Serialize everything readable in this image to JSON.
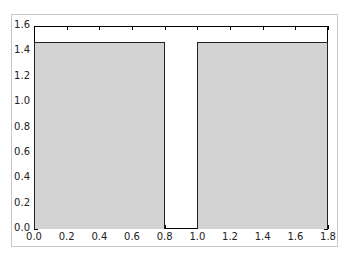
{
  "chart_data": {
    "type": "bar",
    "title": "",
    "xlabel": "",
    "ylabel": "",
    "bars": [
      {
        "x_start": 0.0,
        "x_end": 0.8,
        "value": 1.47
      },
      {
        "x_start": 1.0,
        "x_end": 1.8,
        "value": 1.47
      }
    ],
    "categories": [
      "0.0-0.8",
      "1.0-1.8"
    ],
    "values": [
      1.47,
      1.47
    ],
    "xlim": [
      0.0,
      1.8
    ],
    "ylim": [
      0.0,
      1.6
    ],
    "xticks": [
      "0.0",
      "0.2",
      "0.4",
      "0.6",
      "0.8",
      "1.0",
      "1.2",
      "1.4",
      "1.6",
      "1.8"
    ],
    "yticks": [
      "0.0",
      "0.2",
      "0.4",
      "0.6",
      "0.8",
      "1.0",
      "1.2",
      "1.4",
      "1.6"
    ],
    "grid": false,
    "legend": null,
    "bar_color": "#d3d3d3",
    "edge_color": "#222222"
  }
}
